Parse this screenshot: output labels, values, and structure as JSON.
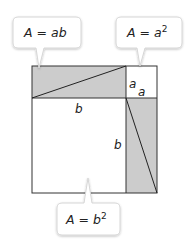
{
  "diagram": {
    "title": "",
    "colors": {
      "shaded": "#cccccc",
      "stroke": "#333333",
      "callout_fill": "#ffffff",
      "callout_stroke": "#d6d6d6"
    },
    "side_labels": {
      "a_vertical": "a",
      "a_horizontal": "a",
      "b_horizontal": "b",
      "b_vertical": "b"
    },
    "callouts": [
      {
        "id": "ab",
        "prefix": "A",
        "eq": " = ",
        "value": "ab",
        "sup": ""
      },
      {
        "id": "a2",
        "prefix": "A",
        "eq": " = ",
        "value": "a",
        "sup": "2"
      },
      {
        "id": "b2",
        "prefix": "A",
        "eq": " = ",
        "value": "b",
        "sup": "2"
      }
    ]
  }
}
